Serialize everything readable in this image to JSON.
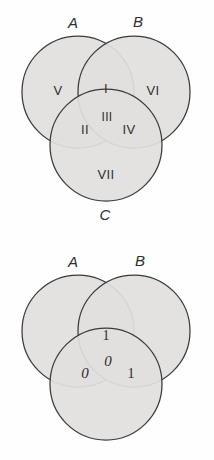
{
  "figures": [
    {
      "id": "venn-roman-regions",
      "set_labels": {
        "a": "A",
        "b": "B",
        "c": "C"
      },
      "regions": [
        {
          "key": "a_only",
          "label": "V"
        },
        {
          "key": "a_and_b",
          "label": "I"
        },
        {
          "key": "b_only",
          "label": "VI"
        },
        {
          "key": "a_and_c",
          "label": "II"
        },
        {
          "key": "a_b_c",
          "label": "III"
        },
        {
          "key": "b_and_c",
          "label": "IV"
        },
        {
          "key": "c_only",
          "label": "VII"
        }
      ]
    },
    {
      "id": "venn-binary-values",
      "set_labels": {
        "a": "A",
        "b": "B",
        "c": ""
      },
      "regions": [
        {
          "key": "a_only",
          "label": ""
        },
        {
          "key": "a_and_b",
          "label": "1"
        },
        {
          "key": "b_only",
          "label": ""
        },
        {
          "key": "a_and_c",
          "label": "0"
        },
        {
          "key": "a_b_c",
          "label": "0"
        },
        {
          "key": "b_and_c",
          "label": "1"
        },
        {
          "key": "c_only",
          "label": ""
        }
      ]
    }
  ],
  "style": {
    "circle_fill": "#e2e0de",
    "circle_stroke": "#3a3a3a",
    "background": "#fefefe",
    "text_color": "#2e2e2e"
  }
}
